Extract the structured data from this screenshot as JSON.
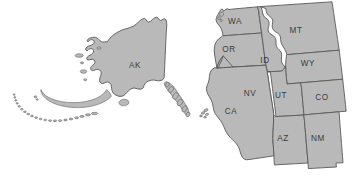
{
  "map": {
    "title": "Western United States and Alaska",
    "projection": "albers-usa-style composite",
    "background_color": "#ffffff",
    "state_fill_color": "#b9b9b9",
    "state_border_color": "#5a5a5a",
    "label_color": "#3b3b3b",
    "regions": [
      {
        "code": "AK",
        "name": "Alaska",
        "label": "AK",
        "label_x": 135,
        "label_y": 66,
        "group": "alaska-inset"
      },
      {
        "code": "WA",
        "name": "Washington",
        "label": "WA",
        "label_x": 235,
        "label_y": 22,
        "group": "contiguous-west"
      },
      {
        "code": "OR",
        "name": "Oregon",
        "label": "OR",
        "label_x": 229,
        "label_y": 50,
        "group": "contiguous-west"
      },
      {
        "code": "ID",
        "name": "Idaho",
        "label": "ID",
        "label_x": 265,
        "label_y": 61,
        "group": "contiguous-west"
      },
      {
        "code": "MT",
        "name": "Montana",
        "label": "MT",
        "label_x": 296,
        "label_y": 31,
        "group": "contiguous-west"
      },
      {
        "code": "WY",
        "name": "Wyoming",
        "label": "WY",
        "label_x": 308,
        "label_y": 64,
        "group": "contiguous-west"
      },
      {
        "code": "NV",
        "name": "Nevada",
        "label": "NV",
        "label_x": 250,
        "label_y": 94,
        "group": "contiguous-west"
      },
      {
        "code": "UT",
        "name": "Utah",
        "label": "UT",
        "label_x": 281,
        "label_y": 96,
        "group": "contiguous-west"
      },
      {
        "code": "CO",
        "name": "Colorado",
        "label": "CO",
        "label_x": 322,
        "label_y": 98,
        "group": "contiguous-west"
      },
      {
        "code": "CA",
        "name": "California",
        "label": "CA",
        "label_x": 231,
        "label_y": 112,
        "group": "contiguous-west"
      },
      {
        "code": "AZ",
        "name": "Arizona",
        "label": "AZ",
        "label_x": 283,
        "label_y": 139,
        "group": "contiguous-west"
      },
      {
        "code": "NM",
        "name": "New Mexico",
        "label": "NM",
        "label_x": 318,
        "label_y": 139,
        "group": "contiguous-west"
      }
    ],
    "unlabeled_features": [
      {
        "name": "aleutian-islands",
        "group": "alaska-inset"
      },
      {
        "name": "alexander-archipelago",
        "group": "alaska-inset"
      },
      {
        "name": "kodiak-island",
        "group": "alaska-inset"
      },
      {
        "name": "pribilof-islands",
        "group": "alaska-inset"
      },
      {
        "name": "channel-islands",
        "group": "contiguous-west"
      },
      {
        "name": "puget-sound-islands",
        "group": "contiguous-west"
      }
    ]
  }
}
